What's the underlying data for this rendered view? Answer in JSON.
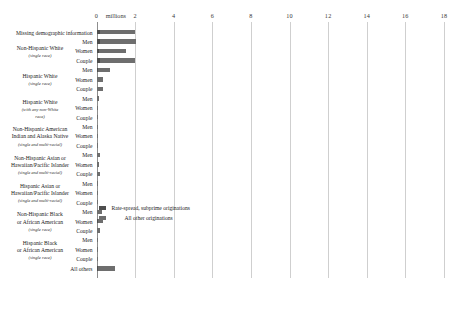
{
  "chart_data": {
    "type": "bar",
    "orientation": "horizontal",
    "title": "",
    "xlabel": "millions",
    "ylabel": "",
    "xlim": [
      0,
      18
    ],
    "xticks": [
      0,
      2,
      4,
      6,
      8,
      10,
      12,
      14,
      16,
      18
    ],
    "xtick_labels": [
      "0",
      "2",
      "4",
      "6",
      "8",
      "10",
      "12",
      "14",
      "16",
      "18"
    ],
    "unit_label": "millions",
    "grid": true,
    "stacked": true,
    "legend_position": "center",
    "legend": [
      {
        "name": "Rate-spread, subprime originations",
        "color": "#4e4e4e"
      },
      {
        "name": "All other originations",
        "color": "#6e6e6e"
      }
    ],
    "series": [
      {
        "name": "Rate-spread, subprime originations",
        "color": "#4e4e4e"
      },
      {
        "name": "All other originations",
        "color": "#6e6e6e"
      }
    ],
    "groups": [
      {
        "label_lines": [],
        "label_italic_lines": [],
        "rows": [
          {
            "category": "Missing demographic information",
            "standalone": true,
            "subprime": 0.18,
            "other": 1.82
          }
        ]
      },
      {
        "label_lines": [
          "Non-Hispanic White"
        ],
        "label_italic_lines": [
          "(single race)"
        ],
        "rows": [
          {
            "category": "Men",
            "subprime": 0.17,
            "other": 1.88
          },
          {
            "category": "Women",
            "subprime": 0.14,
            "other": 1.38
          },
          {
            "category": "Couple",
            "subprime": 0.16,
            "other": 1.85
          }
        ]
      },
      {
        "label_lines": [
          "Hispanic White"
        ],
        "label_italic_lines": [
          "(single race)"
        ],
        "rows": [
          {
            "category": "Men",
            "subprime": 0.07,
            "other": 0.62
          },
          {
            "category": "Women",
            "subprime": 0.04,
            "other": 0.3
          },
          {
            "category": "Couple",
            "subprime": 0.05,
            "other": 0.27
          }
        ]
      },
      {
        "label_lines": [
          "Hispanic White"
        ],
        "label_italic_lines": [
          "(with any non-White",
          "race)"
        ],
        "rows": [
          {
            "category": "Men",
            "subprime": 0.02,
            "other": 0.1
          },
          {
            "category": "Women",
            "subprime": 0.01,
            "other": 0.05
          },
          {
            "category": "Couple",
            "subprime": 0.01,
            "other": 0.05
          }
        ]
      },
      {
        "label_lines": [
          "Non-Hispanic American",
          "Indian and Alaska Native"
        ],
        "label_italic_lines": [
          "(single and multi-racial)"
        ],
        "rows": [
          {
            "category": "Men",
            "subprime": 0.01,
            "other": 0.03
          },
          {
            "category": "Women",
            "subprime": 0.01,
            "other": 0.02
          },
          {
            "category": "Couple",
            "subprime": 0.01,
            "other": 0.03
          }
        ]
      },
      {
        "label_lines": [
          "Non-Hispanic Asian or",
          "Hawaiian/Pacific Islander"
        ],
        "label_italic_lines": [
          "(single and multi-racial)"
        ],
        "rows": [
          {
            "category": "Men",
            "subprime": 0.02,
            "other": 0.12
          },
          {
            "category": "Women",
            "subprime": 0.01,
            "other": 0.09
          },
          {
            "category": "Couple",
            "subprime": 0.02,
            "other": 0.14
          }
        ]
      },
      {
        "label_lines": [
          "Hispanic Asian or",
          "Hawaiian/Pacific Islander"
        ],
        "label_italic_lines": [
          "(single and multi-racial)"
        ],
        "rows": [
          {
            "category": "Men",
            "subprime": 0.0,
            "other": 0.01
          },
          {
            "category": "Women",
            "subprime": 0.0,
            "other": 0.01
          },
          {
            "category": "Couple",
            "subprime": 0.0,
            "other": 0.01
          }
        ]
      },
      {
        "label_lines": [
          "Non-Hispanic Black",
          "or African American"
        ],
        "label_italic_lines": [
          "(single race)"
        ],
        "rows": [
          {
            "category": "Men",
            "subprime": 0.05,
            "other": 0.21
          },
          {
            "category": "Women",
            "subprime": 0.07,
            "other": 0.28
          },
          {
            "category": "Couple",
            "subprime": 0.04,
            "other": 0.16
          }
        ]
      },
      {
        "label_lines": [
          "Hispanic Black",
          "or African American"
        ],
        "label_italic_lines": [
          "(single race)"
        ],
        "rows": [
          {
            "category": "Men",
            "subprime": 0.01,
            "other": 0.02
          },
          {
            "category": "Women",
            "subprime": 0.01,
            "other": 0.02
          },
          {
            "category": "Couple",
            "subprime": 0.0,
            "other": 0.02
          }
        ]
      },
      {
        "label_lines": [],
        "label_italic_lines": [],
        "rows": [
          {
            "category": "All others",
            "standalone": true,
            "subprime": 0.1,
            "other": 0.85
          }
        ]
      }
    ]
  }
}
